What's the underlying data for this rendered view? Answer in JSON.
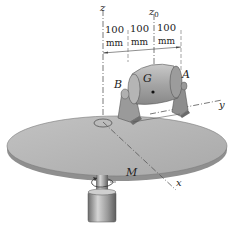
{
  "figure": {
    "axes": {
      "z": "z",
      "z0": "z",
      "z0_sub": "0",
      "y": "y",
      "x": "x"
    },
    "points": {
      "A": "A",
      "B": "B",
      "G": "G"
    },
    "moment": "M",
    "dimensions": [
      {
        "value": "100",
        "unit": "mm"
      },
      {
        "value": "100",
        "unit": "mm"
      },
      {
        "value": "100",
        "unit": "mm"
      }
    ],
    "colors": {
      "disk": "#b3b3b3",
      "disk_edge": "#8c8c8c",
      "motor": "#a8a8a8",
      "bracket": "#9a9a9a",
      "shaft": "#9e9e9e",
      "line": "#555555"
    }
  }
}
